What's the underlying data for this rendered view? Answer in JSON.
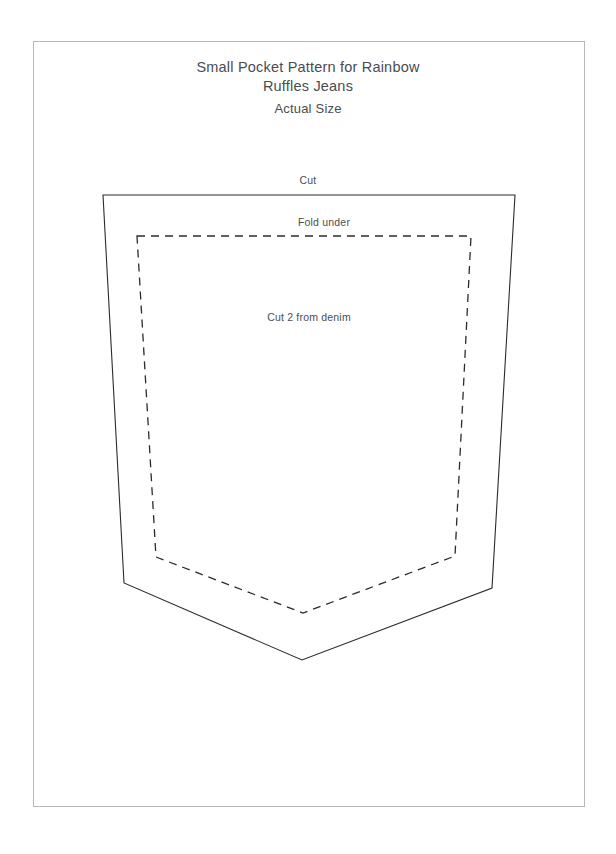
{
  "document": {
    "title_lines": [
      "Small Pocket Pattern for Rainbow",
      "Ruffles Jeans"
    ],
    "subtitle": "Actual Size"
  },
  "pattern": {
    "labels": {
      "cut": "Cut",
      "fold_under": "Fold under",
      "cut_2_from_denim": "Cut 2 from denim"
    },
    "colors": {
      "outline": "#2b2b2b",
      "fold_line": "#2b2b2b",
      "page_border": "#b9b9bc",
      "text": "#4b4b50",
      "background": "#ffffff"
    },
    "cut_line_points": "103,195 515,195 492,588 302,660 124,583",
    "fold_line_points": "137,236 471,236 455,556 303,613 156,557",
    "dash_pattern": "8 6"
  }
}
